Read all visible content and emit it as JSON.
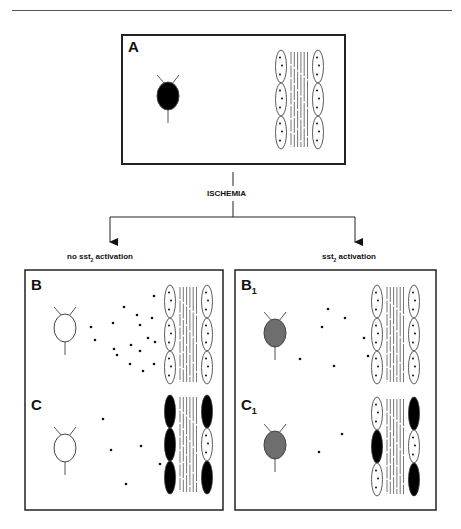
{
  "header": {
    "running_title": "… and Giovanni Casini"
  },
  "flow": {
    "trigger_label": "ISCHEMIA",
    "left_branch": {
      "prefix": "no sst",
      "subscript": "2",
      "suffix": " activation"
    },
    "right_branch": {
      "prefix": "sst",
      "subscript": "2",
      "suffix": " activation"
    }
  },
  "panels": [
    {
      "id": "A",
      "letter": "A",
      "subscript": "",
      "neuron_fill": "#000000",
      "box": [
        122,
        35,
        223,
        129
      ],
      "neuron": [
        168,
        96
      ],
      "muscle": {
        "x": 281,
        "y": 50,
        "left": [
          "open",
          "open",
          "open"
        ],
        "right": [
          "open",
          "open",
          "open"
        ]
      },
      "dots": []
    },
    {
      "id": "B",
      "letter": "B",
      "subscript": "",
      "neuron_fill": "#ffffff",
      "box": [
        25,
        270,
        198,
        120
      ],
      "neuron": [
        65,
        328
      ],
      "muscle": {
        "x": 170,
        "y": 285,
        "left": [
          "open",
          "open",
          "open"
        ],
        "right": [
          "open",
          "open",
          "open"
        ]
      },
      "dots": [
        [
          91,
          327
        ],
        [
          95,
          340
        ],
        [
          113,
          323
        ],
        [
          114,
          349
        ],
        [
          117,
          355
        ],
        [
          124,
          307
        ],
        [
          131,
          345
        ],
        [
          130,
          364
        ],
        [
          137,
          315
        ],
        [
          140,
          325
        ],
        [
          140,
          351
        ],
        [
          143,
          371
        ],
        [
          148,
          338
        ],
        [
          154,
          296
        ],
        [
          152,
          318
        ],
        [
          155,
          342
        ],
        [
          154,
          364
        ]
      ]
    },
    {
      "id": "C",
      "letter": "C",
      "subscript": "",
      "neuron_fill": "#ffffff",
      "box": [
        25,
        390,
        198,
        120
      ],
      "neuron": [
        65,
        448
      ],
      "muscle": {
        "x": 170,
        "y": 395,
        "left": [
          "solid",
          "solid",
          "solid"
        ],
        "right": [
          "solid",
          "open",
          "solid"
        ]
      },
      "dots": [
        [
          103,
          419
        ],
        [
          111,
          450
        ],
        [
          141,
          446
        ],
        [
          160,
          464
        ],
        [
          126,
          484
        ]
      ]
    },
    {
      "id": "B1",
      "letter": "B",
      "subscript": "1",
      "neuron_fill": "#6e6e6e",
      "box": [
        235,
        270,
        201,
        120
      ],
      "neuron": [
        275,
        333
      ],
      "muscle": {
        "x": 377,
        "y": 285,
        "left": [
          "open",
          "open",
          "open"
        ],
        "right": [
          "open",
          "open",
          "open"
        ]
      },
      "dots": [
        [
          328,
          309
        ],
        [
          345,
          318
        ],
        [
          322,
          327
        ],
        [
          364,
          338
        ],
        [
          368,
          356
        ],
        [
          300,
          359
        ],
        [
          334,
          366
        ]
      ]
    },
    {
      "id": "C1",
      "letter": "C",
      "subscript": "1",
      "neuron_fill": "#6e6e6e",
      "box": [
        235,
        390,
        201,
        120
      ],
      "neuron": [
        275,
        445
      ],
      "muscle": {
        "x": 377,
        "y": 397,
        "left": [
          "open",
          "solid",
          "open"
        ],
        "right": [
          "solid",
          "open",
          "solid"
        ]
      },
      "dots": [
        [
          342,
          434
        ],
        [
          319,
          452
        ]
      ]
    }
  ],
  "colors": {
    "line": "#222222",
    "stroke_gray": "#555555",
    "neuron_gray": "#6e6e6e"
  }
}
